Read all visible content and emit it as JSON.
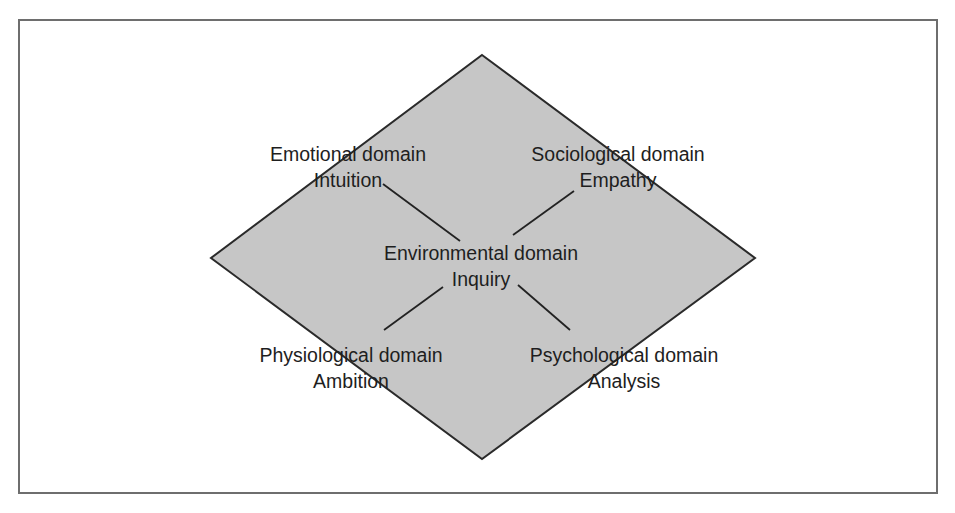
{
  "diagram": {
    "type": "diamond-domain-model",
    "colors": {
      "diamond_fill": "#c6c6c6",
      "diamond_stroke": "#2a2a2a",
      "connector_stroke": "#222222",
      "frame_stroke": "#6e6e6e",
      "text": "#1e1e1e",
      "background": "#ffffff"
    },
    "center": {
      "domain": "Environmental domain",
      "trait": "Inquiry"
    },
    "nodes": [
      {
        "id": "emotional",
        "position": "top-left",
        "domain": "Emotional domain",
        "trait": "Intuition"
      },
      {
        "id": "sociological",
        "position": "top-right",
        "domain": "Sociological domain",
        "trait": "Empathy"
      },
      {
        "id": "physiological",
        "position": "bottom-left",
        "domain": "Physiological domain",
        "trait": "Ambition"
      },
      {
        "id": "psychological",
        "position": "bottom-right",
        "domain": "Psychological domain",
        "trait": "Analysis"
      }
    ],
    "edges": [
      {
        "from": "environmental",
        "to": "emotional"
      },
      {
        "from": "environmental",
        "to": "sociological"
      },
      {
        "from": "environmental",
        "to": "physiological"
      },
      {
        "from": "environmental",
        "to": "psychological"
      }
    ]
  }
}
